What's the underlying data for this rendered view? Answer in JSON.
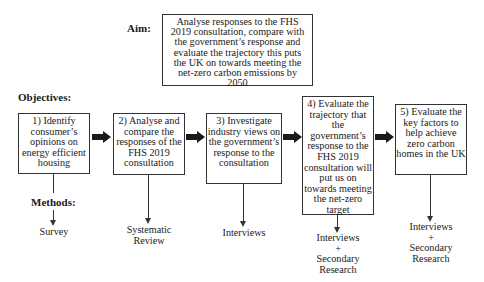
{
  "aim": {
    "label": "Aim:",
    "text": "Analyse responses to the FHS 2019 consultation, compare with the government’s response and evaluate the trajectory this puts the UK on towards meeting the net-zero carbon emissions by 2050"
  },
  "objectives_label": "Objectives:",
  "methods_label": "Methods:",
  "objectives": [
    {
      "text": "1) Identify consumer’s opinions on energy efficient housing",
      "method": "Survey"
    },
    {
      "text": "2) Analyse and compare the responses of the FHS 2019 consultation",
      "method": "Systematic Review"
    },
    {
      "text": "3) Investigate industry views on the government’s response to the consultation",
      "method": "Interviews"
    },
    {
      "text": "4) Evaluate the trajectory that the government’s response to the FHS 2019 consultation will put us on towards meeting the net-zero target",
      "method": "Interviews + Secondary Research"
    },
    {
      "text": "5) Evaluate the key factors to help achieve zero carbon homes in the UK",
      "method": "Interviews + Secondary Research"
    }
  ],
  "method_lines": {
    "m0": [
      "Survey"
    ],
    "m1": [
      "Systematic",
      "Review"
    ],
    "m2": [
      "Interviews"
    ],
    "m3": [
      "Interviews",
      "+",
      "Secondary",
      "Research"
    ],
    "m4": [
      "Interviews",
      "+",
      "Secondary",
      "Research"
    ]
  },
  "colors": {
    "line": "#333333",
    "arrow": "#1a1a1a",
    "background": "#ffffff"
  }
}
